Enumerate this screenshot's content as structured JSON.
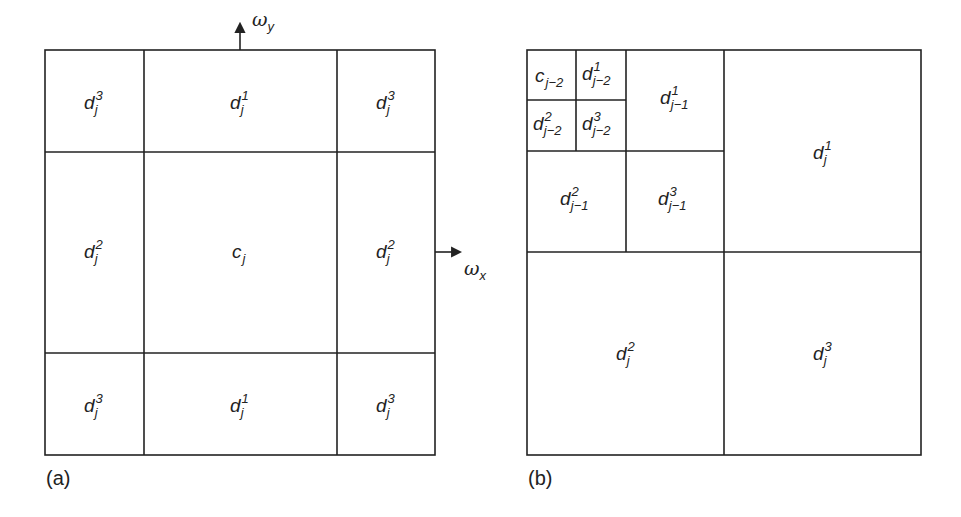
{
  "figure": {
    "panel_a": {
      "caption": "(a)",
      "axes": {
        "x_label": "ω",
        "x_sub": "x",
        "y_label": "ω",
        "y_sub": "y"
      },
      "cells": [
        {
          "id": "tl",
          "base": "d",
          "sup": "3",
          "sub": "j"
        },
        {
          "id": "tm",
          "base": "d",
          "sup": "1",
          "sub": "j"
        },
        {
          "id": "tr",
          "base": "d",
          "sup": "3",
          "sub": "j"
        },
        {
          "id": "ml",
          "base": "d",
          "sup": "2",
          "sub": "j"
        },
        {
          "id": "mm",
          "base": "c",
          "sup": "",
          "sub": "j"
        },
        {
          "id": "mr",
          "base": "d",
          "sup": "2",
          "sub": "j"
        },
        {
          "id": "bl",
          "base": "d",
          "sup": "3",
          "sub": "j"
        },
        {
          "id": "bm",
          "base": "d",
          "sup": "1",
          "sub": "j"
        },
        {
          "id": "br",
          "base": "d",
          "sup": "3",
          "sub": "j"
        }
      ]
    },
    "panel_b": {
      "caption": "(b)",
      "cells": [
        {
          "id": "c_j-2",
          "base": "c",
          "sup": "",
          "sub": "j−2"
        },
        {
          "id": "d1_j-2",
          "base": "d",
          "sup": "1",
          "sub": "j−2"
        },
        {
          "id": "d2_j-2",
          "base": "d",
          "sup": "2",
          "sub": "j−2"
        },
        {
          "id": "d3_j-2",
          "base": "d",
          "sup": "3",
          "sub": "j−2"
        },
        {
          "id": "d1_j-1",
          "base": "d",
          "sup": "1",
          "sub": "j−1"
        },
        {
          "id": "d2_j-1",
          "base": "d",
          "sup": "2",
          "sub": "j−1"
        },
        {
          "id": "d3_j-1",
          "base": "d",
          "sup": "3",
          "sub": "j−1"
        },
        {
          "id": "d1_j",
          "base": "d",
          "sup": "1",
          "sub": "j"
        },
        {
          "id": "d2_j",
          "base": "d",
          "sup": "2",
          "sub": "j"
        },
        {
          "id": "d3_j",
          "base": "d",
          "sup": "3",
          "sub": "j"
        }
      ]
    }
  }
}
